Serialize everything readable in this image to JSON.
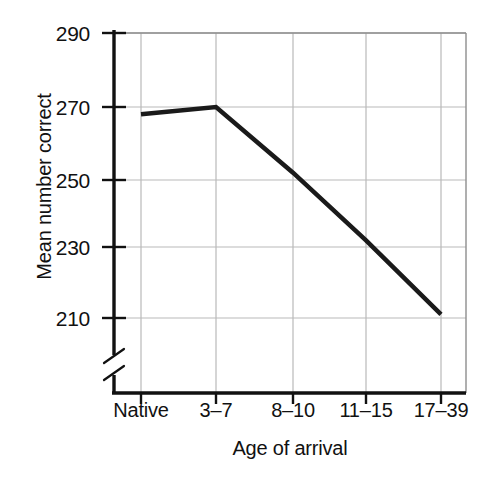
{
  "chart_data": {
    "type": "line",
    "title": "",
    "xlabel": "Age of arrival",
    "ylabel": "Mean number correct",
    "categories": [
      "Native",
      "3–7",
      "8–10",
      "11–15",
      "17–39"
    ],
    "values": [
      268,
      270,
      252,
      232,
      211
    ],
    "series": [
      {
        "name": "Mean number correct",
        "values": [
          268,
          270,
          252,
          232,
          211
        ]
      }
    ],
    "ylim": [
      210,
      290
    ],
    "yticks": [
      210,
      230,
      250,
      270,
      290
    ],
    "ytick_labels": [
      "210",
      "230",
      "250",
      "270",
      "290"
    ],
    "axis_break": true,
    "axis_break_note": "y-axis broken below 210",
    "grid": true,
    "grid_axis": "both",
    "legend": false,
    "legend_position": "none",
    "colors": {
      "line": "#1a1a1a",
      "grid": "#b9b9b9",
      "axis": "#111111",
      "background": "#ffffff",
      "text": "#111111"
    },
    "line_width_px": 4.5
  },
  "axes": {
    "x_title": "Age of arrival",
    "y_title": "Mean number correct"
  }
}
